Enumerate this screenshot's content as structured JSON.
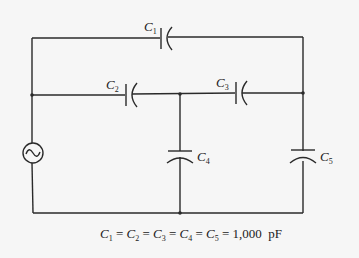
{
  "diagram": {
    "type": "circuit",
    "source": {
      "name": "AC voltage source",
      "symbol": "~"
    },
    "capacitors": [
      {
        "id": "C1",
        "letter": "C",
        "sub": "1",
        "position": "top branch"
      },
      {
        "id": "C2",
        "letter": "C",
        "sub": "2",
        "position": "middle-left series"
      },
      {
        "id": "C3",
        "letter": "C",
        "sub": "3",
        "position": "middle-right series"
      },
      {
        "id": "C4",
        "letter": "C",
        "sub": "4",
        "position": "center shunt"
      },
      {
        "id": "C5",
        "letter": "C",
        "sub": "5",
        "position": "right shunt"
      }
    ],
    "caption": {
      "terms": [
        {
          "letter": "C",
          "sub": "1"
        },
        {
          "letter": "C",
          "sub": "2"
        },
        {
          "letter": "C",
          "sub": "3"
        },
        {
          "letter": "C",
          "sub": "4"
        },
        {
          "letter": "C",
          "sub": "5"
        }
      ],
      "equals": "=",
      "value": "1,000",
      "unit": "pF"
    },
    "colors": {
      "wire": "#2a2a2a",
      "background": "#f6f6f6"
    }
  }
}
